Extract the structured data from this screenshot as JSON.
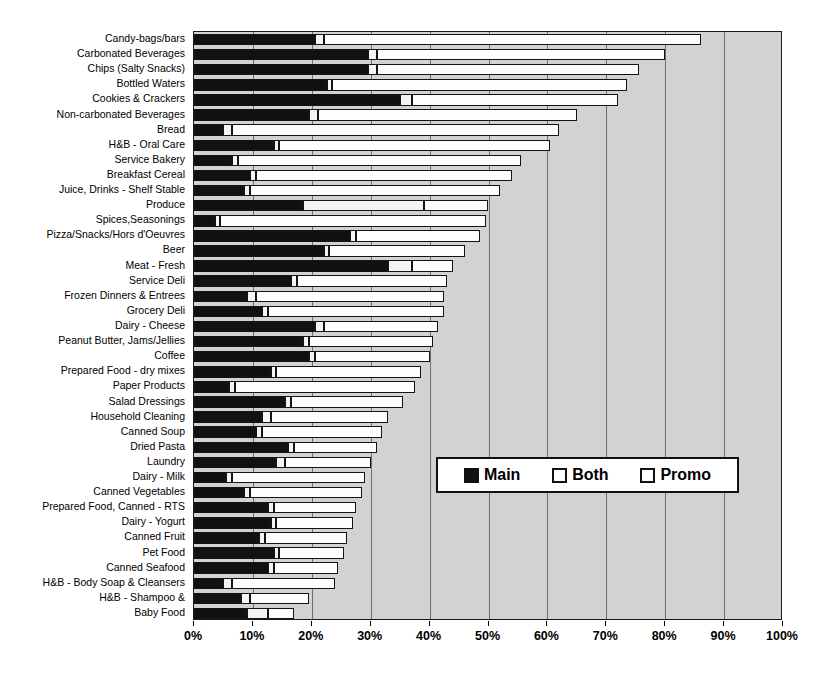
{
  "chart_data": {
    "type": "bar",
    "orientation": "horizontal",
    "stacked": true,
    "title": "",
    "xlabel": "",
    "ylabel": "",
    "xlim": [
      0,
      100
    ],
    "xticks": [
      "0%",
      "10%",
      "20%",
      "30%",
      "40%",
      "50%",
      "60%",
      "70%",
      "80%",
      "90%",
      "100%"
    ],
    "xtick_values": [
      0,
      10,
      20,
      30,
      40,
      50,
      60,
      70,
      80,
      90,
      100
    ],
    "grid": true,
    "legend_position": "middle-right-inside",
    "series": [
      {
        "name": "Main",
        "color": "#111111"
      },
      {
        "name": "Both",
        "color": "#f4f4f4"
      },
      {
        "name": "Promo",
        "color": "#fdfdfd"
      }
    ],
    "categories": [
      "Candy-bags/bars",
      "Carbonated Beverages",
      "Chips (Salty Snacks)",
      "Bottled Waters",
      "Cookies & Crackers",
      "Non-carbonated Beverages",
      "Bread",
      "H&B - Oral Care",
      "Service Bakery",
      "Breakfast Cereal",
      "Juice, Drinks - Shelf Stable",
      "Produce",
      "Spices,Seasonings",
      "Pizza/Snacks/Hors d'Oeuvres",
      "Beer",
      "Meat - Fresh",
      "Service Deli",
      "Frozen Dinners & Entrees",
      "Grocery Deli",
      "Dairy - Cheese",
      "Peanut Butter, Jams/Jellies",
      "Coffee",
      "Prepared Food - dry mixes",
      "Paper Products",
      "Salad Dressings",
      "Household Cleaning",
      "Canned Soup",
      "Dried Pasta",
      "Laundry",
      "Dairy - Milk",
      "Canned Vegetables",
      "Prepared Food, Canned - RTS",
      "Dairy - Yogurt",
      "Canned Fruit",
      "Pet Food",
      "Canned Seafood",
      "H&B - Body Soap & Cleansers",
      "H&B - Shampoo &",
      "Baby Food"
    ],
    "rows": [
      {
        "category": "Candy-bags/bars",
        "main": 20.5,
        "both": 1.5,
        "promo": 64.0,
        "total": 86.0
      },
      {
        "category": "Carbonated Beverages",
        "main": 29.5,
        "both": 1.5,
        "promo": 49.0,
        "total": 80.0
      },
      {
        "category": "Chips (Salty Snacks)",
        "main": 29.5,
        "both": 1.5,
        "promo": 44.5,
        "total": 75.5
      },
      {
        "category": "Bottled Waters",
        "main": 22.5,
        "both": 1.0,
        "promo": 50.0,
        "total": 73.5
      },
      {
        "category": "Cookies & Crackers",
        "main": 35.0,
        "both": 2.0,
        "promo": 35.0,
        "total": 72.0
      },
      {
        "category": "Non-carbonated Beverages",
        "main": 19.5,
        "both": 1.5,
        "promo": 44.0,
        "total": 65.0
      },
      {
        "category": "Bread",
        "main": 5.0,
        "both": 1.5,
        "promo": 55.5,
        "total": 62.0
      },
      {
        "category": "H&B - Oral Care",
        "main": 13.5,
        "both": 1.0,
        "promo": 46.0,
        "total": 60.5
      },
      {
        "category": "Service Bakery",
        "main": 6.5,
        "both": 1.0,
        "promo": 48.0,
        "total": 55.5
      },
      {
        "category": "Breakfast Cereal",
        "main": 9.5,
        "both": 1.0,
        "promo": 43.5,
        "total": 54.0
      },
      {
        "category": "Juice, Drinks - Shelf Stable",
        "main": 8.5,
        "both": 1.0,
        "promo": 42.5,
        "total": 52.0
      },
      {
        "category": "Produce",
        "main": 18.5,
        "both": 20.5,
        "promo": 11.0,
        "total": 50.0
      },
      {
        "category": "Spices,Seasonings",
        "main": 3.5,
        "both": 1.0,
        "promo": 45.0,
        "total": 49.5
      },
      {
        "category": "Pizza/Snacks/Hors d'Oeuvres",
        "main": 26.5,
        "both": 1.0,
        "promo": 21.0,
        "total": 48.5
      },
      {
        "category": "Beer",
        "main": 22.0,
        "both": 1.0,
        "promo": 23.0,
        "total": 46.0
      },
      {
        "category": "Meat - Fresh",
        "main": 33.0,
        "both": 4.0,
        "promo": 7.0,
        "total": 44.0
      },
      {
        "category": "Service Deli",
        "main": 16.5,
        "both": 1.0,
        "promo": 25.5,
        "total": 43.0
      },
      {
        "category": "Frozen Dinners & Entrees",
        "main": 9.0,
        "both": 1.5,
        "promo": 32.0,
        "total": 42.5
      },
      {
        "category": "Grocery Deli",
        "main": 11.5,
        "both": 1.0,
        "promo": 30.0,
        "total": 42.5
      },
      {
        "category": "Dairy - Cheese",
        "main": 20.5,
        "both": 1.5,
        "promo": 19.5,
        "total": 41.5
      },
      {
        "category": "Peanut Butter, Jams/Jellies",
        "main": 18.5,
        "both": 1.0,
        "promo": 21.0,
        "total": 40.5
      },
      {
        "category": "Coffee",
        "main": 19.5,
        "both": 1.0,
        "promo": 19.5,
        "total": 40.0
      },
      {
        "category": "Prepared Food - dry mixes",
        "main": 13.0,
        "both": 1.0,
        "promo": 24.5,
        "total": 38.5
      },
      {
        "category": "Paper Products",
        "main": 6.0,
        "both": 1.0,
        "promo": 30.5,
        "total": 37.5
      },
      {
        "category": "Salad Dressings",
        "main": 15.5,
        "both": 1.0,
        "promo": 19.0,
        "total": 35.5
      },
      {
        "category": "Household Cleaning",
        "main": 11.5,
        "both": 1.5,
        "promo": 20.0,
        "total": 33.0
      },
      {
        "category": "Canned Soup",
        "main": 10.5,
        "both": 1.0,
        "promo": 20.5,
        "total": 32.0
      },
      {
        "category": "Dried Pasta",
        "main": 16.0,
        "both": 1.0,
        "promo": 14.0,
        "total": 31.0
      },
      {
        "category": "Laundry",
        "main": 14.0,
        "both": 1.5,
        "promo": 14.5,
        "total": 30.0
      },
      {
        "category": "Dairy - Milk",
        "main": 5.5,
        "both": 1.0,
        "promo": 22.5,
        "total": 29.0
      },
      {
        "category": "Canned Vegetables",
        "main": 8.5,
        "both": 1.0,
        "promo": 19.0,
        "total": 28.5
      },
      {
        "category": "Prepared Food, Canned - RTS",
        "main": 12.5,
        "both": 1.0,
        "promo": 14.0,
        "total": 27.5
      },
      {
        "category": "Dairy - Yogurt",
        "main": 13.0,
        "both": 1.0,
        "promo": 13.0,
        "total": 27.0
      },
      {
        "category": "Canned Fruit",
        "main": 11.0,
        "both": 1.0,
        "promo": 14.0,
        "total": 26.0
      },
      {
        "category": "Pet Food",
        "main": 13.5,
        "both": 1.0,
        "promo": 11.0,
        "total": 25.5
      },
      {
        "category": "Canned Seafood",
        "main": 12.5,
        "both": 1.0,
        "promo": 11.0,
        "total": 24.5
      },
      {
        "category": "H&B - Body Soap & Cleansers",
        "main": 5.0,
        "both": 1.5,
        "promo": 17.5,
        "total": 24.0
      },
      {
        "category": "H&B - Shampoo &",
        "main": 8.0,
        "both": 1.5,
        "promo": 10.0,
        "total": 19.5
      },
      {
        "category": "Baby Food",
        "main": 9.0,
        "both": 3.5,
        "promo": 4.5,
        "total": 17.0
      }
    ]
  },
  "legend": {
    "items": [
      {
        "label": "Main",
        "swatch": "filled-black-swatch"
      },
      {
        "label": "Both",
        "swatch": "outline-white-swatch"
      },
      {
        "label": "Promo",
        "swatch": "outline-white-swatch"
      }
    ]
  }
}
